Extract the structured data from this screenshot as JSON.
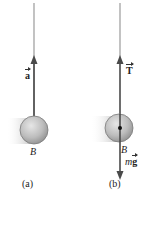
{
  "figure": {
    "panels": [
      {
        "id": "a",
        "caption": "(a)",
        "body_label": "B",
        "vectors": [
          {
            "symbol": "a",
            "direction": "up",
            "label_position": "left"
          }
        ]
      },
      {
        "id": "b",
        "caption": "(b)",
        "body_label": "B",
        "vectors": [
          {
            "symbol": "T",
            "direction": "up",
            "label_position": "right"
          },
          {
            "symbol_prefix": "m",
            "symbol": "g",
            "direction": "down",
            "label_position": "right"
          }
        ]
      }
    ]
  },
  "colors": {
    "string": "#8a8a8a",
    "arrow": "#4a4a4a",
    "ball_fill": "#b8b8b8",
    "ball_edge": "#7a7a7a",
    "text": "#222222"
  }
}
